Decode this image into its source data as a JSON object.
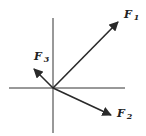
{
  "diagram": {
    "type": "force-vector-diagram",
    "origin": [
      53,
      88
    ],
    "axes": {
      "vertical": {
        "x": 53,
        "y1": 18,
        "y2": 133
      },
      "horizontal": {
        "y": 88,
        "x1": 9,
        "x2": 125
      }
    },
    "vectors": [
      {
        "id": "F1",
        "symbol": "F",
        "subscript": "1",
        "tip": [
          118,
          22
        ],
        "label_pos": [
          124,
          9
        ]
      },
      {
        "id": "F2",
        "symbol": "F",
        "subscript": "2",
        "tip": [
          111,
          115
        ],
        "label_pos": [
          117,
          108
        ]
      },
      {
        "id": "F3",
        "symbol": "F",
        "subscript": "3",
        "tip": [
          34,
          69
        ],
        "label_pos": [
          34,
          51
        ]
      }
    ],
    "stroke_color": "#2a2a2a",
    "background": "#ffffff"
  }
}
